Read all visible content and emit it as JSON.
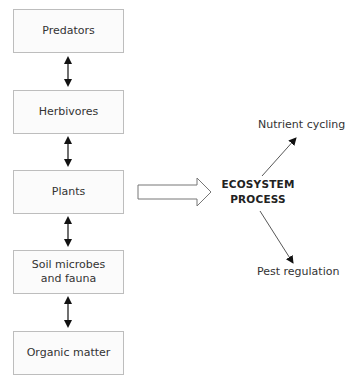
{
  "diagram": {
    "chain": [
      {
        "label": "Predators"
      },
      {
        "label": "Herbivores"
      },
      {
        "label": "Plants"
      },
      {
        "label": "Soil microbes and fauna",
        "line1": "Soil microbes",
        "line2": "and fauna"
      },
      {
        "label": "Organic matter"
      }
    ],
    "center": {
      "line1": "ECOSYSTEM",
      "line2": "PROCESS"
    },
    "outputs": [
      {
        "label": "Nutrient cycling"
      },
      {
        "label": "Pest regulation"
      }
    ],
    "connectors": {
      "chain_links": "bidirectional",
      "plants_to_process": "block-arrow",
      "process_to_outputs": "single-arrow"
    },
    "colors": {
      "box_border": "#bdbdbd",
      "box_fill": "#fbfbfb",
      "arrow": "#111111"
    }
  }
}
